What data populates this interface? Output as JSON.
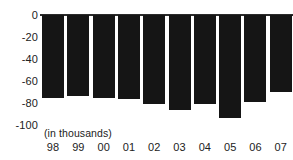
{
  "chart_data": {
    "type": "bar",
    "title": "",
    "subtitle": "",
    "xlabel": "",
    "ylabel": "",
    "unit_note": "(in thousands)",
    "categories": [
      "98",
      "99",
      "00",
      "01",
      "02",
      "03",
      "04",
      "05",
      "06",
      "07"
    ],
    "values": [
      -75,
      -74,
      -75,
      -76,
      -81,
      -86,
      -81,
      -94,
      -79,
      -70
    ],
    "series": [
      {
        "name": "",
        "values": [
          -75,
          -74,
          -75,
          -76,
          -81,
          -86,
          -81,
          -94,
          -79,
          -70
        ]
      }
    ],
    "ylim": [
      -100,
      0
    ],
    "yticks": [
      0,
      -20,
      -40,
      -60,
      -80,
      -100
    ],
    "ytick_labels": [
      "0",
      "-20",
      "-40",
      "-60",
      "-80",
      "-100"
    ],
    "grid": false,
    "legend": false,
    "legend_position": "none",
    "bar_color": "#151515",
    "axis_color": "#2b2b2b",
    "text_color": "#222222",
    "orientation": "vertical",
    "baseline": 0
  }
}
